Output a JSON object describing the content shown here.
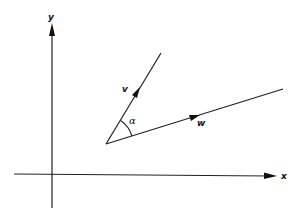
{
  "diagram": {
    "title": "",
    "axes": {
      "x_label": "x",
      "y_label": "y"
    },
    "vectors": [
      {
        "name": "v",
        "label": "v"
      },
      {
        "name": "w",
        "label": "w"
      }
    ],
    "angle_label": "α",
    "colors": {
      "stroke": "#222222",
      "background": "#ffffff"
    }
  }
}
